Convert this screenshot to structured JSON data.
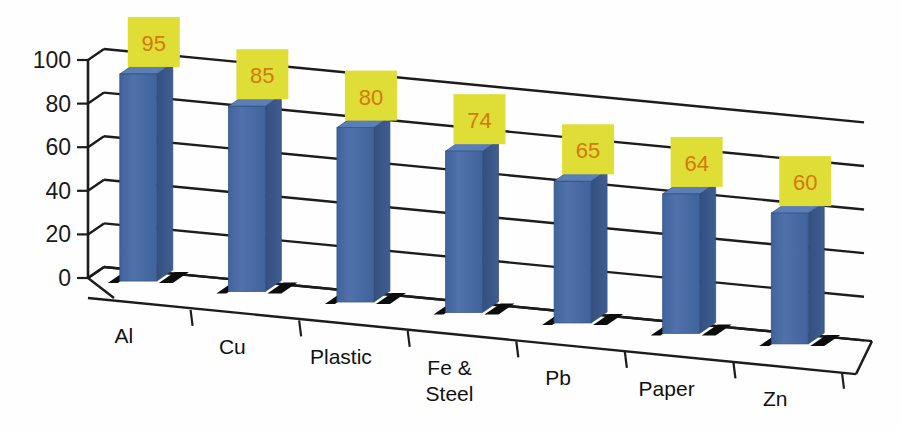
{
  "chart_data": {
    "type": "bar",
    "title": "",
    "subtitle": "",
    "xlabel": "",
    "ylabel": "",
    "categories": [
      "Al",
      "Cu",
      "Plastic",
      "Fe &\nSteel",
      "Pb",
      "Paper",
      "Zn"
    ],
    "category_labels": [
      {
        "line1": "Al",
        "line2": ""
      },
      {
        "line1": "Cu",
        "line2": ""
      },
      {
        "line1": "Plastic",
        "line2": ""
      },
      {
        "line1": "Fe &",
        "line2": "Steel"
      },
      {
        "line1": "Pb",
        "line2": ""
      },
      {
        "line1": "Paper",
        "line2": ""
      },
      {
        "line1": "Zn",
        "line2": ""
      }
    ],
    "values": [
      95,
      85,
      80,
      74,
      65,
      64,
      60
    ],
    "value_labels": [
      "95",
      "85",
      "80",
      "74",
      "65",
      "64",
      "60"
    ],
    "ylim": [
      0,
      100
    ],
    "ytick_labels": [
      "0",
      "20",
      "40",
      "60",
      "80",
      "100"
    ],
    "ytick_values": [
      0,
      20,
      40,
      60,
      80,
      100
    ],
    "grid": true,
    "legend": false,
    "legend_position": "none",
    "style": "3d-column",
    "colors": {
      "bar_front": "#4a6ca4",
      "bar_side": "#3a5888",
      "bar_top": "#5a7cb4",
      "label_box_fill": "#dede36",
      "label_text": "#d4780f",
      "axis": "#1c1c1c",
      "gridline": "#1c1c1c",
      "shadow": "#111111",
      "background": "#fefefe"
    }
  },
  "axis": {
    "y_ticks": [
      "100",
      "80",
      "60",
      "40",
      "20",
      "0"
    ]
  }
}
